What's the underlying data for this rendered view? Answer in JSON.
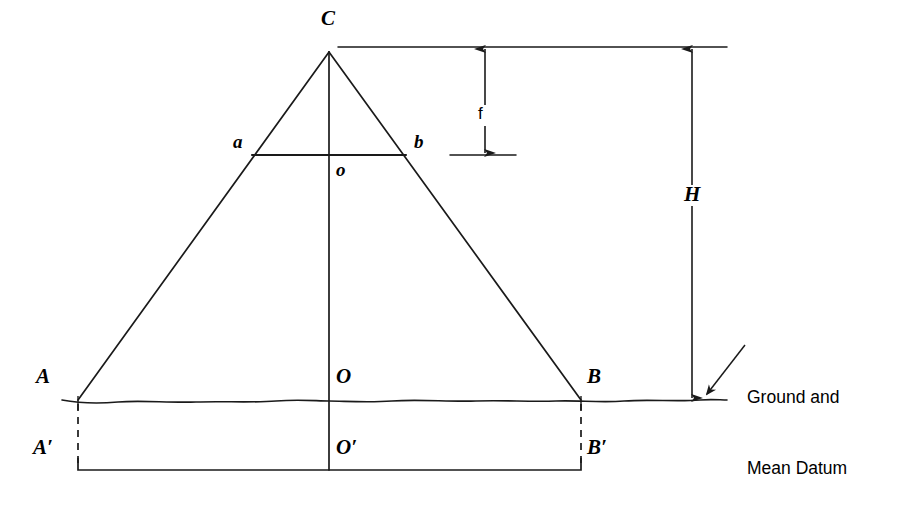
{
  "figure": {
    "kind": "photogrammetry-geometry-diagram",
    "background_color": "#ffffff",
    "line_color": "#1a1a1a",
    "width": 900,
    "height": 520
  },
  "labels": {
    "apex_C": "C",
    "image_left_a": "a",
    "image_right_b": "b",
    "image_center_o": "o",
    "ground_left_A": "A",
    "ground_right_B": "B",
    "ground_center_O": "O",
    "datum_left_A_prime": "A′",
    "datum_right_B_prime": "B′",
    "datum_center_O_prime": "O′",
    "focal_length_f": "f",
    "flying_height_H": "H"
  },
  "annotations": {
    "ground_datum_note_line1": "Ground and",
    "ground_datum_note_line2": "Mean Datum"
  },
  "geometry": {
    "apex": {
      "x": 329,
      "y": 52
    },
    "ground_left": {
      "x": 78,
      "y": 400
    },
    "ground_right": {
      "x": 581,
      "y": 400
    },
    "image_plane_y": 155,
    "image_left": {
      "x": 254,
      "y": 155
    },
    "image_right": {
      "x": 404,
      "y": 155
    },
    "datum_line_y": 470,
    "center_axis_x": 329,
    "top_reference_line": {
      "y": 47,
      "x1": 338,
      "x2": 727
    },
    "ground_line": {
      "y": 400,
      "x1": 62,
      "x2": 727
    },
    "f_dimension_x": 485,
    "H_dimension_x": 692
  }
}
